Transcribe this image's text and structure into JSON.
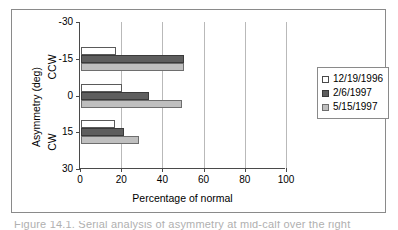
{
  "chart_data": {
    "type": "bar",
    "orientation": "horizontal",
    "title": "",
    "xlabel": "Percentage of normal",
    "ylabel": "Asymmetry (deg)",
    "ylim": [
      -30,
      30
    ],
    "xlim": [
      0,
      100
    ],
    "grid": "vertical",
    "legend_position": "right",
    "xticks": [
      "0",
      "20",
      "40",
      "60",
      "80",
      "100"
    ],
    "xtick_values": [
      0,
      20,
      40,
      60,
      80,
      100
    ],
    "yticks": [
      "-30",
      "-15",
      "0",
      "15",
      "30"
    ],
    "ytick_values": [
      -30,
      -15,
      0,
      15,
      30
    ],
    "direction_labels": {
      "upper": "CCW",
      "lower": "CW"
    },
    "categories": [
      -15,
      0,
      15
    ],
    "category_labels": [
      "-15",
      "0",
      "15"
    ],
    "series": [
      {
        "name": "12/19/1996",
        "color": "#ffffff",
        "values": [
          17,
          20,
          16.5
        ]
      },
      {
        "name": "2/6/1997",
        "color": "#5e5e5e",
        "values": [
          50,
          33,
          21
        ]
      },
      {
        "name": "5/15/1997",
        "color": "#bfbfbf",
        "values": [
          50,
          49,
          28
        ]
      }
    ]
  },
  "axis": {
    "x_title": "Percentage of normal",
    "y_title": "Asymmetry (deg)",
    "y_dir_upper": "CCW",
    "y_dir_lower": "CW",
    "xticks": [
      "0",
      "20",
      "40",
      "60",
      "80",
      "100"
    ],
    "yticks": [
      "-30",
      "-15",
      "0",
      "15",
      "30"
    ]
  },
  "legend": {
    "items": [
      {
        "label": "12/19/1996",
        "swatch": "legend-swatch-white"
      },
      {
        "label": "2/6/1997",
        "swatch": "legend-swatch-dark-gray"
      },
      {
        "label": "5/15/1997",
        "swatch": "legend-swatch-light-gray"
      }
    ]
  },
  "caption": {
    "fragment": "Figure 14.1.  Serial analysis of asymmetry at mid-calf over the right"
  },
  "colors": {
    "series_1": "#ffffff",
    "series_2": "#5e5e5e",
    "series_3": "#bfbfbf",
    "frame": "#8a8a8a",
    "axis": "#4a4a4a",
    "gridline": "#b9b9b9"
  }
}
